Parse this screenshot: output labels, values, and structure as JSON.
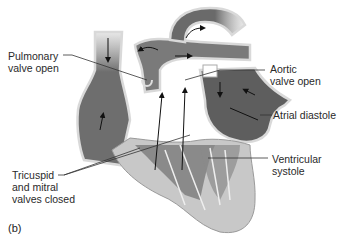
{
  "figure": {
    "panel_label": "(b)",
    "labels": {
      "pulmonary": "Pulmonary\nvalve open",
      "aortic": "Aortic\nvalve open",
      "atrial": "Atrial diastole",
      "ventricular": "Ventricular\nsystole",
      "tricuspid": "Tricuspid\nand mitral\nvalves closed"
    },
    "colors": {
      "chamber_dark": "#5e5e5e",
      "chamber_mid": "#8a8a8a",
      "vessel_wall": "#d9d9d9",
      "myocardium": "#c8c8c8",
      "leader_line": "#333333",
      "text": "#2a2a2a"
    }
  }
}
